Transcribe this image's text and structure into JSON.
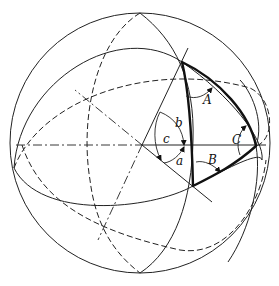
{
  "figure": {
    "labels": {
      "A": "A",
      "B": "B",
      "C": "C",
      "a": "a",
      "b": "b",
      "c": "c"
    }
  }
}
